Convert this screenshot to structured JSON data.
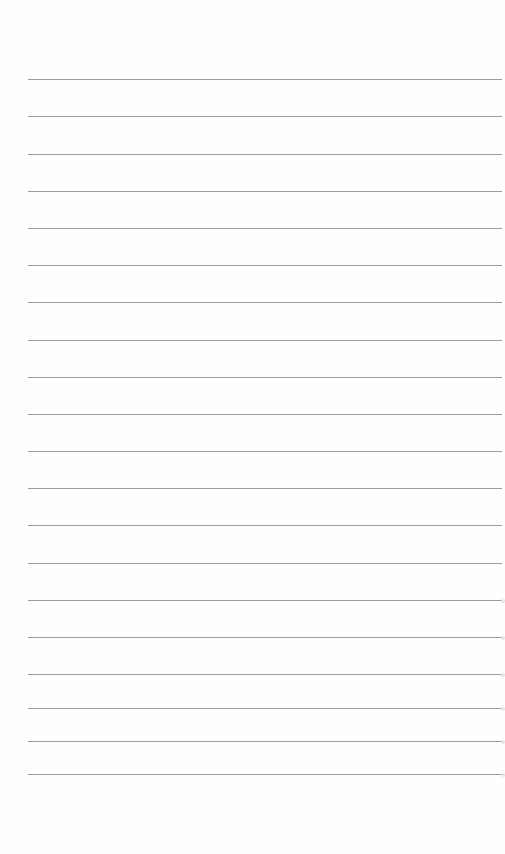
{
  "page": {
    "type": "lined-paper",
    "background": "#fefefe",
    "rule_color": "#9c9c9c",
    "rule_left": 28,
    "rule_width": 474,
    "rules_y": [
      79,
      116,
      154,
      191,
      228,
      265,
      302,
      340,
      377,
      414,
      451,
      488,
      525,
      563,
      600,
      637,
      674,
      708,
      741,
      774
    ]
  }
}
